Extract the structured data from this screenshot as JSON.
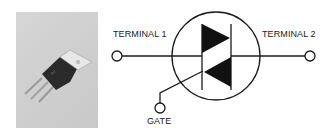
{
  "figure": {
    "photo": {
      "subject": "triac-to220-package"
    },
    "diagram": {
      "title": "Triac schematic symbol",
      "labels": {
        "terminal1": "TERMINAL 1",
        "terminal2": "TERMINAL 2",
        "gate": "GATE"
      }
    }
  }
}
